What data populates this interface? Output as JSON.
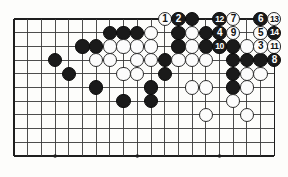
{
  "figure": {
    "kind": "go-board-diagram",
    "title": "",
    "board": {
      "cols": 20,
      "rows": 11,
      "origin_x": 14,
      "origin_y": 19,
      "step": 13.7,
      "line_color": "#3a3a3a",
      "edge_color": "#1e1e1e",
      "background": "#fdfdfb",
      "star_points": [
        {
          "col": 3,
          "row": 10
        },
        {
          "col": 9,
          "row": 10
        },
        {
          "col": 15,
          "row": 10
        },
        {
          "col": 9,
          "row": 3
        }
      ]
    },
    "stone_colors": {
      "black": "#1a1a1a",
      "white": "#fcfcfc",
      "black_label": "#ffffff",
      "white_label": "#111111"
    },
    "stones": [
      {
        "col": 11,
        "row": 0,
        "color": "white",
        "label": "1"
      },
      {
        "col": 12,
        "row": 0,
        "color": "black",
        "label": "2"
      },
      {
        "col": 13,
        "row": 0,
        "color": "black",
        "label": ""
      },
      {
        "col": 15,
        "row": 0,
        "color": "black",
        "label": "12"
      },
      {
        "col": 16,
        "row": 0,
        "color": "white",
        "label": "7"
      },
      {
        "col": 18,
        "row": 0,
        "color": "black",
        "label": "6"
      },
      {
        "col": 19,
        "row": 0,
        "color": "white",
        "label": "13"
      },
      {
        "col": 7,
        "row": 1,
        "color": "black",
        "label": ""
      },
      {
        "col": 8,
        "row": 1,
        "color": "black",
        "label": ""
      },
      {
        "col": 9,
        "row": 1,
        "color": "black",
        "label": ""
      },
      {
        "col": 10,
        "row": 1,
        "color": "white",
        "label": ""
      },
      {
        "col": 12,
        "row": 1,
        "color": "black",
        "label": ""
      },
      {
        "col": 13,
        "row": 1,
        "color": "white",
        "label": ""
      },
      {
        "col": 14,
        "row": 1,
        "color": "black",
        "label": ""
      },
      {
        "col": 15,
        "row": 1,
        "color": "black",
        "label": "4"
      },
      {
        "col": 16,
        "row": 1,
        "color": "white",
        "label": "9"
      },
      {
        "col": 18,
        "row": 1,
        "color": "white",
        "label": "5"
      },
      {
        "col": 19,
        "row": 1,
        "color": "black",
        "label": "14"
      },
      {
        "col": 5,
        "row": 2,
        "color": "black",
        "label": ""
      },
      {
        "col": 6,
        "row": 2,
        "color": "black",
        "label": ""
      },
      {
        "col": 7,
        "row": 2,
        "color": "white",
        "label": ""
      },
      {
        "col": 8,
        "row": 2,
        "color": "white",
        "label": ""
      },
      {
        "col": 9,
        "row": 2,
        "color": "white",
        "label": ""
      },
      {
        "col": 10,
        "row": 2,
        "color": "white",
        "label": ""
      },
      {
        "col": 12,
        "row": 2,
        "color": "black",
        "label": ""
      },
      {
        "col": 13,
        "row": 2,
        "color": "white",
        "label": ""
      },
      {
        "col": 14,
        "row": 2,
        "color": "black",
        "label": ""
      },
      {
        "col": 15,
        "row": 2,
        "color": "black",
        "label": "10"
      },
      {
        "col": 16,
        "row": 2,
        "color": "black",
        "label": ""
      },
      {
        "col": 17,
        "row": 2,
        "color": "white",
        "label": ""
      },
      {
        "col": 18,
        "row": 2,
        "color": "white",
        "label": "3"
      },
      {
        "col": 19,
        "row": 2,
        "color": "white",
        "label": "11"
      },
      {
        "col": 3,
        "row": 3,
        "color": "black",
        "label": ""
      },
      {
        "col": 6,
        "row": 3,
        "color": "white",
        "label": ""
      },
      {
        "col": 7,
        "row": 3,
        "color": "white",
        "label": ""
      },
      {
        "col": 9,
        "row": 3,
        "color": "white",
        "label": ""
      },
      {
        "col": 10,
        "row": 3,
        "color": "white",
        "label": ""
      },
      {
        "col": 11,
        "row": 3,
        "color": "black",
        "label": ""
      },
      {
        "col": 12,
        "row": 3,
        "color": "white",
        "label": ""
      },
      {
        "col": 13,
        "row": 3,
        "color": "white",
        "label": ""
      },
      {
        "col": 14,
        "row": 3,
        "color": "white",
        "label": ""
      },
      {
        "col": 16,
        "row": 3,
        "color": "black",
        "label": ""
      },
      {
        "col": 17,
        "row": 3,
        "color": "black",
        "label": ""
      },
      {
        "col": 18,
        "row": 3,
        "color": "black",
        "label": ""
      },
      {
        "col": 19,
        "row": 3,
        "color": "black",
        "label": "8"
      },
      {
        "col": 4,
        "row": 4,
        "color": "black",
        "label": ""
      },
      {
        "col": 8,
        "row": 4,
        "color": "white",
        "label": ""
      },
      {
        "col": 9,
        "row": 4,
        "color": "white",
        "label": ""
      },
      {
        "col": 11,
        "row": 4,
        "color": "black",
        "label": ""
      },
      {
        "col": 16,
        "row": 4,
        "color": "black",
        "label": ""
      },
      {
        "col": 17,
        "row": 4,
        "color": "white",
        "label": ""
      },
      {
        "col": 18,
        "row": 4,
        "color": "white",
        "label": ""
      },
      {
        "col": 6,
        "row": 5,
        "color": "black",
        "label": ""
      },
      {
        "col": 10,
        "row": 5,
        "color": "black",
        "label": ""
      },
      {
        "col": 13,
        "row": 5,
        "color": "white",
        "label": ""
      },
      {
        "col": 14,
        "row": 5,
        "color": "white",
        "label": ""
      },
      {
        "col": 16,
        "row": 5,
        "color": "black",
        "label": ""
      },
      {
        "col": 17,
        "row": 5,
        "color": "white",
        "label": ""
      },
      {
        "col": 8,
        "row": 6,
        "color": "black",
        "label": ""
      },
      {
        "col": 10,
        "row": 6,
        "color": "black",
        "label": ""
      },
      {
        "col": 16,
        "row": 6,
        "color": "white",
        "label": ""
      },
      {
        "col": 14,
        "row": 7,
        "color": "white",
        "label": ""
      },
      {
        "col": 17,
        "row": 7,
        "color": "white",
        "label": ""
      }
    ]
  }
}
